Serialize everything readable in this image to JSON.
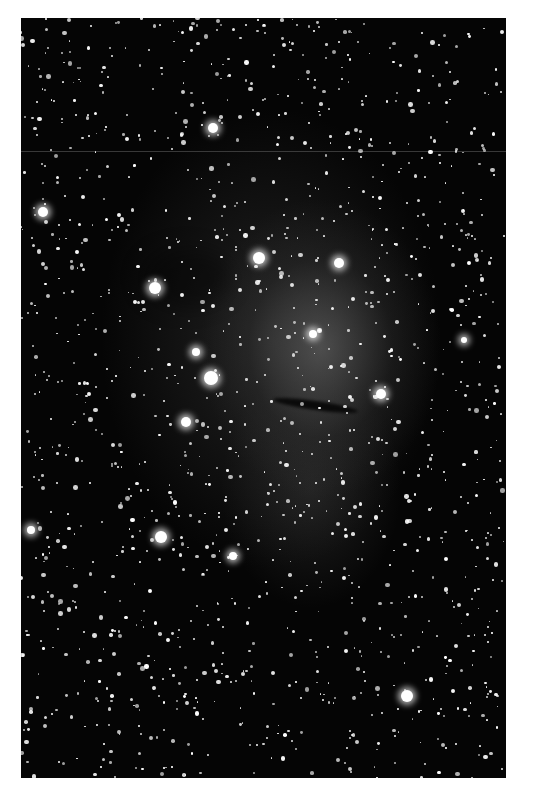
{
  "image": {
    "description": "Black-and-white astrophotograph of an emission nebula embedded in a dense star field, with a dark elongated dust streak near the center",
    "colors": {
      "background": "#ffffff",
      "sky": "#050505",
      "nebula": "#787878",
      "star": "#ffffff"
    },
    "frame": {
      "left": 21,
      "top": 18,
      "width": 485,
      "height": 760
    },
    "bright_stars": [
      {
        "x": 22,
        "y": 194,
        "r": 5
      },
      {
        "x": 192,
        "y": 110,
        "r": 5
      },
      {
        "x": 238,
        "y": 240,
        "r": 6
      },
      {
        "x": 318,
        "y": 245,
        "r": 5
      },
      {
        "x": 134,
        "y": 270,
        "r": 6
      },
      {
        "x": 292,
        "y": 316,
        "r": 4
      },
      {
        "x": 190,
        "y": 360,
        "r": 7
      },
      {
        "x": 175,
        "y": 334,
        "r": 4
      },
      {
        "x": 360,
        "y": 376,
        "r": 5
      },
      {
        "x": 165,
        "y": 404,
        "r": 5
      },
      {
        "x": 140,
        "y": 519,
        "r": 6
      },
      {
        "x": 10,
        "y": 512,
        "r": 4
      },
      {
        "x": 212,
        "y": 538,
        "r": 4
      },
      {
        "x": 386,
        "y": 678,
        "r": 6
      },
      {
        "x": 443,
        "y": 322,
        "r": 3
      }
    ],
    "star_field": {
      "count": 1400,
      "seed": 7,
      "min_r": 0.8,
      "max_r": 2.4
    }
  }
}
